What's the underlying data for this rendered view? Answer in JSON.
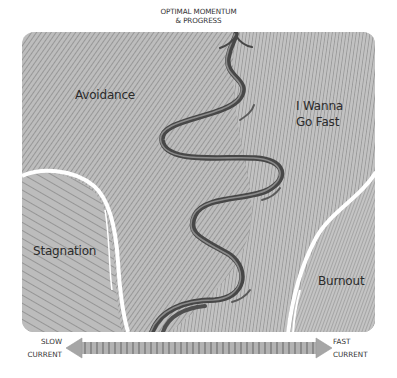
{
  "title": {
    "line1": "OPTIMAL MOMENTUM",
    "line2": "& PROGRESS"
  },
  "regions": {
    "avoidance": {
      "label": "Avoidance"
    },
    "i_wanna_go_fast": {
      "line1": "I Wanna",
      "line2": "Go Fast"
    },
    "stagnation": {
      "label": "Stagnation"
    },
    "burnout": {
      "label": "Burnout"
    }
  },
  "current_axis": {
    "left": {
      "line1": "SLOW",
      "line2": "CURRENT"
    },
    "right": {
      "line1": "FAST",
      "line2": "CURRENT"
    }
  },
  "colors": {
    "panel": "#b9b9b9",
    "hatch": "#7a7a7a",
    "river": "#4a4a4a",
    "river_highlight": "#8a8a8a",
    "channel": "#ffffff",
    "arrow": "#a8a8a8",
    "arrow_ticks": "#6e6e6e"
  }
}
